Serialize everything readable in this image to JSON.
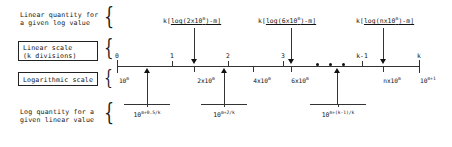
{
  "figure": {
    "ink_color": "#141414"
  },
  "left_labels": {
    "top": {
      "line1": "Linear quantity for",
      "line2": "a given log value"
    },
    "linear_scale_box": {
      "line1": "Linear scale",
      "line2": "(k divisions)"
    },
    "log_scale_box": {
      "line1": "Logarithmic scale"
    },
    "bottom": {
      "line1": "Log quantity for a",
      "line2": "given linear value"
    },
    "brace_glyph": "{"
  },
  "top_annotations": [
    {
      "id": "ann-2x10m",
      "prefix": "k[",
      "underlined": "log(2x10",
      "exp": "m",
      "suffix": ")-m]"
    },
    {
      "id": "ann-6x10m",
      "prefix": "k[",
      "underlined": "log(6x10",
      "exp": "m",
      "suffix": ")-m]"
    },
    {
      "id": "ann-nx10m",
      "prefix": "k[",
      "underlined": "log(nx10",
      "exp": "m",
      "suffix": ")-m]"
    }
  ],
  "linear_scale": {
    "ticks": [
      "0",
      "1",
      "2",
      "3",
      "k-1",
      "k"
    ]
  },
  "log_scale": {
    "labels": [
      {
        "mantissa": "10",
        "exp": "m"
      },
      {
        "mantissa": "2x10",
        "exp": "m"
      },
      {
        "mantissa": "4x10",
        "exp": "m"
      },
      {
        "mantissa": "6x10",
        "exp": "m"
      },
      {
        "mantissa": "nx10",
        "exp": "m"
      },
      {
        "mantissa": "10",
        "exp": "m+1"
      }
    ],
    "ellipsis_dots": 3
  },
  "bottom_annotations": [
    {
      "id": "bot-0p5k",
      "mantissa": "10",
      "exp": "m+0.5/k"
    },
    {
      "id": "bot-2k",
      "mantissa": "10",
      "exp": "m+2/k"
    },
    {
      "id": "bot-k1k",
      "mantissa": "10",
      "exp": "m+(k-1)/k"
    }
  ]
}
